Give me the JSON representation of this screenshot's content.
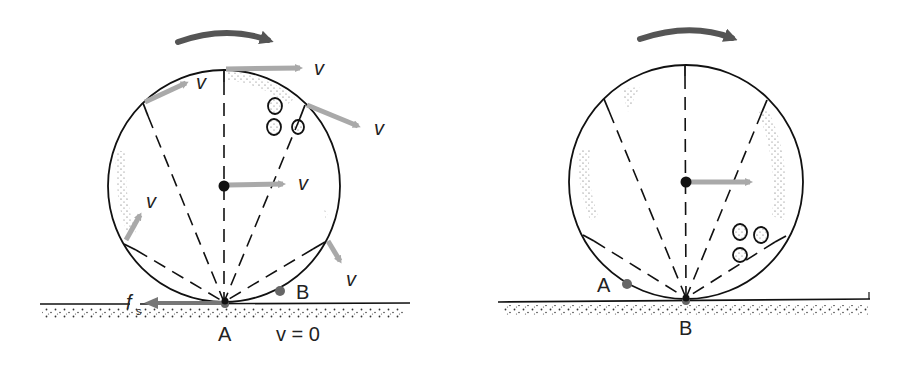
{
  "colors": {
    "rotation_arrow": "#555555",
    "velocity_arrow": "#a9a9a9",
    "friction_arrow": "#777777",
    "point_marker": "#666666",
    "outline": "#111111"
  },
  "left_panel": {
    "labels": {
      "v_top": "v",
      "v_upper_left": "v",
      "v_upper_right": "v",
      "v_center": "v",
      "v_lower_left": "v",
      "v_lower_right": "v",
      "friction": "f",
      "friction_sub": "s",
      "contact_point": "A",
      "other_point": "B",
      "contact_velocity": "v = 0"
    }
  },
  "right_panel": {
    "labels": {
      "contact_point": "B",
      "other_point": "A"
    }
  }
}
